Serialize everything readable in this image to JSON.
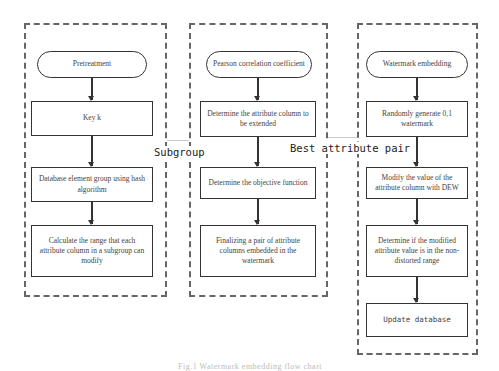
{
  "diagram": {
    "groups": [
      {
        "id": "pretreatment",
        "nodes": [
          {
            "type": "terminator",
            "label": "Pretreatment"
          },
          {
            "type": "process",
            "label": "Key k"
          },
          {
            "type": "process",
            "label": "Database element group using hash algorithm"
          },
          {
            "type": "process",
            "label": "Calculate the range that each attribute column in a subgroup can modify"
          }
        ]
      },
      {
        "id": "pearson",
        "nodes": [
          {
            "type": "terminator",
            "label": "Pearson correlation coefficient"
          },
          {
            "type": "process",
            "label": "Determine the attribute column to be extended"
          },
          {
            "type": "process",
            "label": "Determine the objective function"
          },
          {
            "type": "process",
            "label": "Finalizing a pair of attribute columns embedded in the watermark"
          }
        ]
      },
      {
        "id": "embedding",
        "nodes": [
          {
            "type": "terminator",
            "label": "Watermark embedding"
          },
          {
            "type": "process",
            "label": "Randomly generate 0,1 watermark"
          },
          {
            "type": "process",
            "label": "Modify the value of the attribute column with DEW"
          },
          {
            "type": "process",
            "label": "Determine if the modified attribute value is in the non-distorted range"
          },
          {
            "type": "process",
            "label": "Update database"
          }
        ]
      }
    ],
    "links": [
      {
        "from": "pretreatment",
        "to": "pearson",
        "label": "Subgroup"
      },
      {
        "from": "pearson",
        "to": "embedding",
        "label": "Best attribute pair"
      }
    ],
    "caption": "Fig.1 Watermark embedding flow chart"
  },
  "colors": {
    "border": "#333333",
    "dashed_border": "#666666",
    "background": "#ffffff"
  }
}
